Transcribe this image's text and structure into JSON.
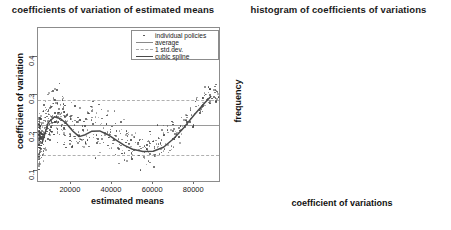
{
  "figure": {
    "panels": [
      {
        "id": "scatter",
        "title": "coefficients of variation of estimated means"
      },
      {
        "id": "histogram",
        "title": "histogram of coefficients of variations"
      }
    ]
  },
  "legend": {
    "entries": [
      {
        "label": "individual policies",
        "key": "points",
        "color": "#444444"
      },
      {
        "label": "average",
        "key": "solid-line",
        "color": "#8a8a8a"
      },
      {
        "label": "1 std.dev.",
        "key": "dashed-line",
        "color": "#a8a8a8"
      },
      {
        "label": "cubic spline",
        "key": "thick-line",
        "color": "#4a4a4a"
      }
    ]
  },
  "chart_data": [
    {
      "type": "scatter",
      "id": "scatter",
      "title": "coefficients of variation of estimated means",
      "xlabel": "estimated means",
      "ylabel": "coefficient of variation",
      "xlim": [
        4000,
        92000
      ],
      "ylim": [
        0.075,
        0.475
      ],
      "xticks": [
        20000,
        40000,
        60000,
        80000
      ],
      "xticklabels": [
        "20000",
        "40000",
        "60000",
        "80000"
      ],
      "yticks": [
        0.1,
        0.2,
        0.3,
        0.4
      ],
      "yticklabels": [
        "0.1",
        "0.2",
        "0.3",
        "0.4"
      ],
      "grid": false,
      "legend_position": "top-right",
      "reference_lines": [
        {
          "name": "average",
          "style": "solid",
          "y": 0.222,
          "color": "#9a9a9a"
        },
        {
          "name": "plus 1 std.dev.",
          "style": "dashed",
          "y": 0.286,
          "color": "#b0b0b0"
        },
        {
          "name": "minus 1 std.dev.",
          "style": "dashed",
          "y": 0.142,
          "color": "#b0b0b0"
        }
      ],
      "series": [
        {
          "name": "cubic spline",
          "type": "line",
          "x": [
            6000,
            9000,
            12000,
            15000,
            18000,
            21000,
            24000,
            27000,
            30000,
            34000,
            38000,
            42000,
            46000,
            50000,
            55000,
            60000,
            65000,
            70000,
            75000,
            80000,
            85000,
            88000
          ],
          "y": [
            0.175,
            0.228,
            0.243,
            0.238,
            0.224,
            0.205,
            0.191,
            0.196,
            0.205,
            0.206,
            0.196,
            0.182,
            0.168,
            0.158,
            0.152,
            0.153,
            0.163,
            0.186,
            0.215,
            0.248,
            0.279,
            0.296
          ]
        },
        {
          "name": "individual policies",
          "type": "points",
          "n_points": 620,
          "x": [
            5800,
            6100,
            6300,
            6500,
            6700,
            6900,
            7200,
            7400,
            7600,
            7800,
            8100,
            8400,
            8700,
            9000,
            9300,
            9600,
            9900,
            10200,
            10600,
            11000,
            11400,
            11800,
            12200,
            12600,
            13000,
            13500,
            14000,
            14500,
            15000,
            15600,
            16200,
            16800,
            17400,
            18000,
            18700,
            19400,
            20100,
            20800,
            21500,
            22300,
            23100,
            23900,
            24700,
            25500,
            26400,
            27300,
            28200,
            29100,
            30000,
            31000,
            32000,
            33000,
            34000,
            35000,
            36100,
            37200,
            38300,
            39400,
            40500,
            41700,
            42900,
            44100,
            45300,
            46500,
            47800,
            49100,
            50400,
            51700,
            53000,
            54400,
            55800,
            57200,
            58600,
            60000,
            61500,
            63000,
            64500,
            66000,
            67600,
            69200,
            70800,
            72400,
            74100,
            75800,
            77500,
            79200,
            81000,
            82800,
            84600,
            86400
          ],
          "y_range": [
            0.085,
            0.47
          ],
          "description": "dense cloud concentrated at low estimated means with long right tail"
        }
      ]
    },
    {
      "type": "bar",
      "id": "histogram",
      "title": "histogram of coefficients of variations",
      "xlabel": "coefficient of variations",
      "ylabel": "frequency",
      "xlim": [
        0.05,
        0.5
      ],
      "ylim": [
        0,
        255
      ],
      "xticks": [
        0.1,
        0.2,
        0.3,
        0.4,
        0.5
      ],
      "xticklabels": [
        "0.1",
        "0.2",
        "0.3",
        "0.4",
        "0.5"
      ],
      "yticks": [
        0,
        50,
        100,
        150,
        200,
        250
      ],
      "yticklabels": [
        "0",
        "50",
        "100",
        "150",
        "200",
        "250"
      ],
      "grid": false,
      "bin_edges": [
        0.05,
        0.1,
        0.15,
        0.2,
        0.25,
        0.3,
        0.35,
        0.4,
        0.45,
        0.5
      ],
      "bin_labels": [
        "0.05-0.10",
        "0.10-0.15",
        "0.15-0.20",
        "0.20-0.25",
        "0.25-0.30",
        "0.30-0.35",
        "0.35-0.40",
        "0.40-0.45",
        "0.45-0.50"
      ],
      "values": [
        2,
        93,
        245,
        157,
        88,
        50,
        15,
        12,
        3
      ],
      "bar_fill": "#b9b9b9",
      "bar_stroke": "#6a6a6a"
    }
  ]
}
